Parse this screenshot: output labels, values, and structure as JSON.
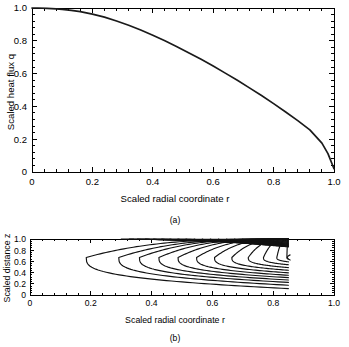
{
  "figure": {
    "panels": [
      {
        "id": "a",
        "caption": "(a)",
        "xlabel": "Scaled radial coordinate r",
        "ylabel": "Scaled heat flux q"
      },
      {
        "id": "b",
        "caption": "(b)",
        "xlabel": "Scaled radial coordinate r",
        "ylabel": "Scaled distance z"
      }
    ]
  },
  "chart_data": [
    {
      "type": "line",
      "panel": "a",
      "title": "",
      "xlabel": "Scaled radial coordinate r",
      "ylabel": "Scaled heat flux q",
      "xlim": [
        0,
        1.0
      ],
      "ylim": [
        0,
        1.0
      ],
      "grid": false,
      "legend": null,
      "xticks": [
        0,
        0.2,
        0.4,
        0.6,
        0.8,
        1.0
      ],
      "xtick_labels": [
        "0",
        "0.2",
        "0.4",
        "0.6",
        "0.8",
        "1.0"
      ],
      "yticks": [
        0,
        0.2,
        0.4,
        0.6,
        0.8,
        1.0
      ],
      "ytick_labels": [
        "0",
        "0.2",
        "0.4",
        "0.6",
        "0.8",
        "1.0"
      ],
      "minor_ticks": true,
      "series": [
        {
          "name": "Scaled heat flux",
          "x": [
            0.0,
            0.02,
            0.05,
            0.08,
            0.1,
            0.13,
            0.16,
            0.2,
            0.24,
            0.28,
            0.32,
            0.36,
            0.4,
            0.44,
            0.48,
            0.52,
            0.56,
            0.6,
            0.64,
            0.68,
            0.72,
            0.76,
            0.8,
            0.84,
            0.88,
            0.92,
            0.96,
            0.98,
            1.0
          ],
          "y": [
            1.0,
            1.0,
            0.998,
            0.995,
            0.992,
            0.986,
            0.978,
            0.963,
            0.944,
            0.921,
            0.895,
            0.866,
            0.834,
            0.8,
            0.764,
            0.726,
            0.687,
            0.646,
            0.603,
            0.559,
            0.513,
            0.466,
            0.417,
            0.366,
            0.313,
            0.257,
            0.176,
            0.112,
            0.02
          ]
        }
      ]
    },
    {
      "type": "line",
      "panel": "b",
      "title": "",
      "xlabel": "Scaled radial coordinate r",
      "ylabel": "Scaled distance z",
      "xlim": [
        0,
        1.0
      ],
      "ylim": [
        0,
        1.0
      ],
      "grid": false,
      "legend": null,
      "xticks": [
        0,
        0.2,
        0.4,
        0.6,
        0.8,
        1.0
      ],
      "xtick_labels": [
        "0",
        "0.2",
        "0.4",
        "0.6",
        "0.8",
        "1.0"
      ],
      "yticks": [
        0,
        0.2,
        0.4,
        0.6,
        0.8,
        1.0
      ],
      "ytick_labels": [
        "0",
        "0.2",
        "0.4",
        "0.6",
        "0.8",
        "1.0"
      ],
      "minor_ticks": true,
      "contours": {
        "description": "nested streamline contours opening to the right, anchored on the top boundary z=1 and truncated at r=0.85",
        "cutoff_r": 0.85,
        "center_z": 0.67,
        "levels": [
          {
            "nose_r": 0.185,
            "top_r": 0.86,
            "bottom_z": 0.115
          },
          {
            "nose_r": 0.292,
            "top_r": 0.88,
            "bottom_z": 0.175
          },
          {
            "nose_r": 0.36,
            "top_r": 0.9,
            "bottom_z": 0.225
          },
          {
            "nose_r": 0.424,
            "top_r": 0.91,
            "bottom_z": 0.268
          },
          {
            "nose_r": 0.487,
            "top_r": 0.92,
            "bottom_z": 0.31
          },
          {
            "nose_r": 0.548,
            "top_r": 0.93,
            "bottom_z": 0.352
          },
          {
            "nose_r": 0.607,
            "top_r": 0.94,
            "bottom_z": 0.396
          },
          {
            "nose_r": 0.664,
            "top_r": 0.95,
            "bottom_z": 0.442
          },
          {
            "nose_r": 0.718,
            "top_r": 0.96,
            "bottom_z": 0.49
          },
          {
            "nose_r": 0.768,
            "top_r": 0.965,
            "bottom_z": 0.54
          },
          {
            "nose_r": 0.812,
            "top_r": 0.97,
            "bottom_z": 0.592
          },
          {
            "nose_r": 0.845,
            "top_r": 0.975,
            "bottom_z": 0.64
          }
        ]
      }
    }
  ]
}
